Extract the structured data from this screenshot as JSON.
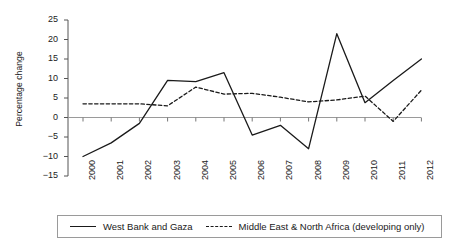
{
  "chart_data": {
    "type": "line",
    "title": "",
    "xlabel": "",
    "ylabel": "Percentage change",
    "ylim": [
      -15,
      25
    ],
    "yticks": [
      -15,
      -10,
      -5,
      0,
      5,
      10,
      15,
      20,
      25
    ],
    "ytick_labels": [
      "−15",
      "−10",
      "−5",
      "0",
      "5",
      "10",
      "15",
      "20",
      "25"
    ],
    "grid": false,
    "legend_position": "bottom",
    "categories": [
      "2000",
      "2001",
      "2002",
      "2003",
      "2004",
      "2005",
      "2006",
      "2007",
      "2008",
      "2009",
      "2010",
      "2011",
      "2012"
    ],
    "series": [
      {
        "name": "West Bank and Gaza",
        "style": "solid",
        "color": "#1a1a1a",
        "values": [
          -10,
          -6.5,
          -1.5,
          9.5,
          9.2,
          11.5,
          -4.5,
          -2,
          -8,
          21.5,
          3.8,
          9.5,
          15
        ]
      },
      {
        "name": "Middle East & North Africa (developing only)",
        "style": "dashed",
        "color": "#1a1a1a",
        "values": [
          3.5,
          3.5,
          3.5,
          3,
          7.8,
          6,
          6.2,
          5.2,
          4,
          4.5,
          5.5,
          -1,
          7
        ]
      }
    ]
  },
  "legend": {
    "entries": [
      {
        "label": "West Bank and Gaza",
        "style": "solid"
      },
      {
        "label": "Middle East & North Africa (developing only)",
        "style": "dashed"
      }
    ]
  }
}
